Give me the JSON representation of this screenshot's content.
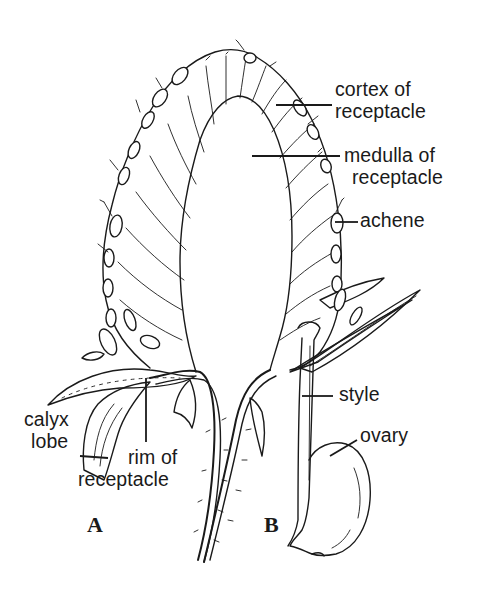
{
  "figure": {
    "labels": {
      "cortex": {
        "line1": "cortex of",
        "line2": "receptacle"
      },
      "medulla": {
        "line1": "medulla of",
        "line2": "receptacle"
      },
      "achene": "achene",
      "style": "style",
      "ovary": "ovary",
      "calyx_lobe": {
        "line1": "calyx",
        "line2": "lobe"
      },
      "rim": {
        "line1": "rim of",
        "line2": "receptacle"
      }
    },
    "panels": {
      "a": "A",
      "b": "B"
    },
    "colors": {
      "ink": "#1a1a1a",
      "background": "#ffffff"
    }
  }
}
